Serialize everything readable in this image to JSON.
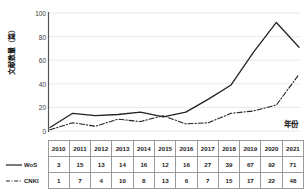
{
  "chart_data": {
    "type": "line",
    "title": "",
    "xlabel": "年份",
    "ylabel": "文献数量（篇）",
    "categories": [
      "2010",
      "2011",
      "2012",
      "2013",
      "2014",
      "2015",
      "2016",
      "2017",
      "2018",
      "2019",
      "2020",
      "2021"
    ],
    "ylim": [
      0,
      100
    ],
    "yticks": [
      0,
      20,
      40,
      60,
      80,
      100
    ],
    "ytick_labels": [
      "0",
      "20",
      "40",
      "60",
      "80",
      "100"
    ],
    "grid": "horizontal",
    "legend_position": "table-below",
    "series": [
      {
        "name": "WoS",
        "style": "solid",
        "color": "#222222",
        "values": [
          3,
          15,
          13,
          14,
          16,
          12,
          16,
          27,
          39,
          67,
          92,
          71
        ]
      },
      {
        "name": "CNKI",
        "style": "dash-dot",
        "color": "#222222",
        "values": [
          1,
          7,
          4,
          10,
          8,
          13,
          6,
          7,
          15,
          17,
          22,
          48
        ]
      }
    ]
  },
  "table": {
    "header_corner": "",
    "columns": [
      "2010",
      "2011",
      "2012",
      "2013",
      "2014",
      "2015",
      "2016",
      "2017",
      "2018",
      "2019",
      "2020",
      "2021"
    ],
    "rows": [
      {
        "label": "WoS",
        "values": [
          "3",
          "15",
          "13",
          "14",
          "16",
          "12",
          "16",
          "27",
          "39",
          "67",
          "92",
          "71"
        ]
      },
      {
        "label": "CNKI",
        "values": [
          "1",
          "7",
          "4",
          "10",
          "8",
          "13",
          "6",
          "7",
          "15",
          "17",
          "22",
          "48"
        ]
      }
    ]
  },
  "axis": {
    "y_title": "文献数量（篇）",
    "x_title": "年份",
    "y_labels": [
      "100",
      "80",
      "60",
      "40",
      "20",
      "0"
    ]
  },
  "colors": {
    "line": "#222222",
    "grid": "#e2e2e2",
    "axis": "#555555",
    "table_border": "#9a9a9a",
    "background": "#ffffff"
  }
}
